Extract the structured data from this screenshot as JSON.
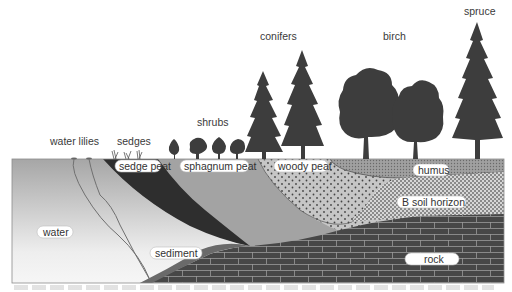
{
  "diagram": {
    "title_labels": {
      "water_lilies": "water lilies",
      "sedges": "sedges",
      "shrubs": "shrubs",
      "conifers": "conifers",
      "birch": "birch",
      "spruce": "spruce"
    },
    "layer_labels": {
      "sedge_peat": "sedge peat",
      "sphagnum_peat": "sphagnum peat",
      "woody_peat": "woody peat",
      "humus": "humus",
      "b_soil_horizon": "B soil horizon",
      "water": "water",
      "sediment": "sediment",
      "rock": "rock"
    },
    "colors": {
      "water_top": "#a8a8a8",
      "water_bottom": "#f2f2f2",
      "sedge_peat": "#2e2e2e",
      "sphagnum_peat": "#a3a3a3",
      "woody_peat": "#c4c4c4",
      "humus": "#9c9c9c",
      "b_soil_horizon": "#d0d0d0",
      "sediment": "#6a6a6a",
      "rock": "#4a4a4a",
      "rock_mortar": "#9a9a9a",
      "vegetation": "#3d3d3d"
    }
  }
}
